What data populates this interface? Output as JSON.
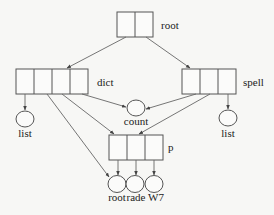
{
  "diagram": {
    "type": "tree/graph structure",
    "nodes": {
      "root": {
        "label": "root",
        "cells": 2
      },
      "dict": {
        "label": "dict",
        "cells": 4
      },
      "spell": {
        "label": "spell",
        "cells": 3
      },
      "count": {
        "label": "count"
      },
      "list_left": {
        "label": "list"
      },
      "list_right": {
        "label": "list"
      },
      "p": {
        "label": "p",
        "cells": 3
      },
      "leaf_root": {
        "label": "root"
      },
      "leaf_rade": {
        "label": "rade"
      },
      "leaf_w7": {
        "label": "W7"
      }
    },
    "edges": [
      {
        "from": "root.cell1",
        "to": "dict"
      },
      {
        "from": "root.cell2",
        "to": "spell"
      },
      {
        "from": "dict.cell1",
        "to": "list_left"
      },
      {
        "from": "dict.cell2",
        "to": "leaf_root"
      },
      {
        "from": "dict.cell3",
        "to": "p"
      },
      {
        "from": "dict.cell4",
        "to": "count"
      },
      {
        "from": "spell.cell1",
        "to": "count"
      },
      {
        "from": "spell.cell2",
        "to": "p"
      },
      {
        "from": "spell.cell3",
        "to": "list_right"
      },
      {
        "from": "p.cell1",
        "to": "leaf_root"
      },
      {
        "from": "p.cell2",
        "to": "leaf_rade"
      },
      {
        "from": "p.cell3",
        "to": "leaf_w7"
      }
    ]
  }
}
